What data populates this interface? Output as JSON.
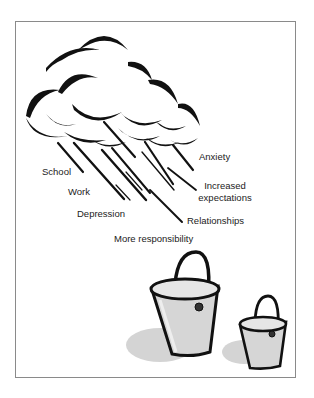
{
  "figure": {
    "cloud": {
      "fill": "#ffffff",
      "stroke": "#111111"
    },
    "rain_color": "#111111",
    "labels": [
      {
        "id": "school",
        "text": "School"
      },
      {
        "id": "work",
        "text": "Work"
      },
      {
        "id": "depression",
        "text": "Depression"
      },
      {
        "id": "more_responsibility",
        "text": "More responsibility"
      },
      {
        "id": "relationships",
        "text": "Relationships"
      },
      {
        "id": "increased_expectations_1",
        "text": "Increased"
      },
      {
        "id": "increased_expectations_2",
        "text": "expectations"
      },
      {
        "id": "anxiety",
        "text": "Anxiety"
      }
    ],
    "buckets": [
      {
        "id": "large-bucket",
        "fill": "#d6d6d6",
        "stroke": "#111111"
      },
      {
        "id": "small-bucket",
        "fill": "#d6d6d6",
        "stroke": "#111111"
      }
    ],
    "shadow_color": "#cfcfcf"
  }
}
